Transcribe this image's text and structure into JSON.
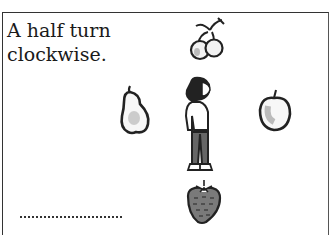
{
  "card": {
    "instruction_line1": "A half turn",
    "instruction_line2": "clockwise.",
    "answer_placeholder": "........................"
  },
  "pictures": {
    "top": "cherries",
    "left": "pear",
    "center": "girl",
    "right": "apple",
    "bottom": "strawberry"
  }
}
